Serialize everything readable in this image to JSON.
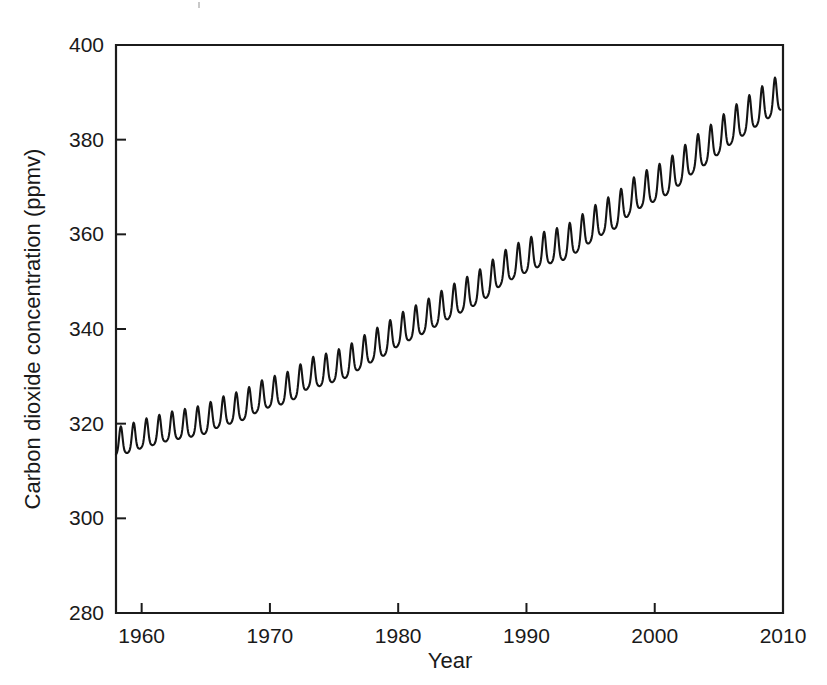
{
  "figure": {
    "background_color": "#ffffff",
    "line_color": "#141414",
    "axis_color": "#1b1b1b"
  },
  "chart_data": {
    "type": "line",
    "title": "",
    "subtitle": "",
    "xlabel": "Year",
    "ylabel": "Carbon dioxide concentration (ppmv)",
    "xlim": [
      1958,
      2010
    ],
    "ylim": [
      280,
      400
    ],
    "xticks": [
      1960,
      1970,
      1980,
      1990,
      2000,
      2010
    ],
    "xtick_labels": [
      "1960",
      "1970",
      "1980",
      "1990",
      "2000",
      "2010"
    ],
    "yticks": [
      280,
      300,
      320,
      340,
      360,
      380,
      400
    ],
    "ytick_labels": [
      "280",
      "300",
      "320",
      "340",
      "360",
      "380",
      "400"
    ],
    "grid": false,
    "legend": false,
    "legend_position": "none",
    "series": [
      {
        "name": "Atmospheric CO2 (Mauna Loa)",
        "color": "#141414",
        "description": "Monthly mean CO2 concentration showing a rising trend with an annual sawtooth seasonal cycle",
        "seasonal_amplitude_ppmv": 6.3,
        "annual_means": {
          "x": [
            1958,
            1959,
            1960,
            1961,
            1962,
            1963,
            1964,
            1965,
            1966,
            1967,
            1968,
            1969,
            1970,
            1971,
            1972,
            1973,
            1974,
            1975,
            1976,
            1977,
            1978,
            1979,
            1980,
            1981,
            1982,
            1983,
            1984,
            1985,
            1986,
            1987,
            1988,
            1989,
            1990,
            1991,
            1992,
            1993,
            1994,
            1995,
            1996,
            1997,
            1998,
            1999,
            2000,
            2001,
            2002,
            2003,
            2004,
            2005,
            2006,
            2007,
            2008,
            2009
          ],
          "y": [
            315.3,
            315.9,
            316.9,
            317.6,
            318.4,
            318.9,
            319.4,
            320.0,
            321.4,
            322.2,
            323.0,
            324.6,
            325.7,
            326.3,
            327.5,
            329.7,
            330.2,
            331.1,
            332.0,
            333.8,
            335.4,
            336.8,
            338.7,
            340.1,
            341.4,
            343.0,
            344.6,
            346.0,
            347.4,
            349.2,
            351.6,
            353.1,
            354.4,
            355.6,
            356.4,
            357.1,
            358.8,
            360.8,
            362.6,
            363.8,
            366.6,
            368.3,
            369.5,
            371.0,
            373.1,
            375.6,
            377.4,
            379.6,
            381.8,
            383.7,
            385.6,
            387.4
          ]
        },
        "start_point": {
          "year": 1958,
          "value": 315.3
        },
        "end_point": {
          "year": 2009,
          "value": 384.2
        },
        "max_point": {
          "year": 2009,
          "value": 388.6
        },
        "min_point": {
          "year": 1958,
          "value": 312.9
        }
      }
    ]
  },
  "axes": {
    "y_axis_title": "Carbon dioxide concentration (ppmv)",
    "x_axis_title": "Year"
  }
}
